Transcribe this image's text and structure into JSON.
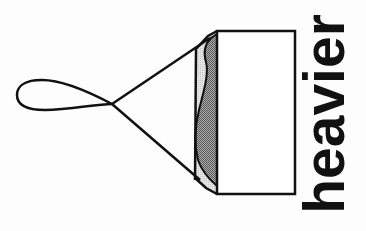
{
  "diagram": {
    "label": "heavier",
    "colors": {
      "stroke": "#111111",
      "background": "#fdfdfd",
      "contents_fill": "#8a8a8a",
      "container_inner_fill": "#d6d6d6",
      "box_fill": "#ffffff"
    },
    "elements": [
      "string-loop",
      "suspension-strings",
      "container-box",
      "container-base",
      "container-contents"
    ]
  }
}
